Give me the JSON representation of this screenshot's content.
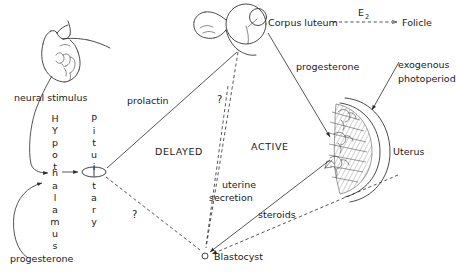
{
  "diagram": {
    "width": 456,
    "height": 274,
    "ink_color": "#2b2b2b",
    "background": "#ffffff"
  },
  "labels": {
    "neural_stimulus": "neural stimulus",
    "prolactin": "prolactin",
    "progesterone_left": "progesterone",
    "progesterone_right": "progesterone",
    "corpus_luteum": "Corpus luteum",
    "e2": "E",
    "e2_subscript": "2",
    "folicle": "Folicle",
    "exogenous": "exogenous",
    "photoperiod": "photoperiod",
    "uterus": "Uterus",
    "uterine": "uterine",
    "secretion": "secretion",
    "steroids": "steroids",
    "blastocyst": "Blastocyst",
    "delayed": "DELAYED",
    "active": "ACTIVE",
    "question_upper": "?",
    "question_lower": "?"
  },
  "vertical_words": {
    "hypothalamus": [
      "H",
      "Y",
      "p",
      "o",
      "t",
      "h",
      "a",
      "l",
      "a",
      "m",
      "u",
      "s"
    ],
    "pituitary": [
      "P",
      "i",
      "t",
      "u",
      "i",
      "t",
      "a",
      "r",
      "y"
    ]
  },
  "organs": {
    "snout": "animal-head-snout",
    "ovary": "ovary-with-corpus-luteum",
    "pituitary": "pituitary-gland",
    "uterus": "uterus-crescent-endometrium",
    "blastocyst": "blastocyst-dot"
  }
}
